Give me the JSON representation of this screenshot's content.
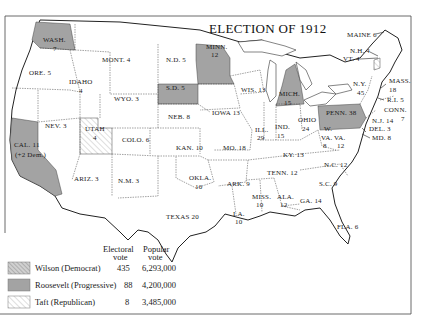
{
  "title": "ELECTION OF 1912",
  "colors": {
    "wilson_fill": "#c9c9c9",
    "wilson_hatch": "#8a8a8a",
    "roosevelt_fill": "#9d9d9d",
    "taft_fill": "#ffffff",
    "taft_hatch": "#b0b0b0",
    "lakes": "#ffffff",
    "frame": "#333333"
  },
  "states": [
    {
      "id": "wash",
      "label": "WASH.",
      "votes": "7",
      "party": "roosevelt"
    },
    {
      "id": "ore",
      "label": "ORE. 5",
      "party": "wilson"
    },
    {
      "id": "cal",
      "label": "CAL. 11",
      "sub": "(+2 Dem.)",
      "party": "roosevelt"
    },
    {
      "id": "nev",
      "label": "NEV. 3",
      "party": "wilson"
    },
    {
      "id": "idaho",
      "label": "IDAHO",
      "votes": "4",
      "party": "wilson"
    },
    {
      "id": "mont",
      "label": "MONT. 4",
      "party": "wilson"
    },
    {
      "id": "wyo",
      "label": "WYO. 3",
      "party": "wilson"
    },
    {
      "id": "utah",
      "label": "UTAH",
      "votes": "4",
      "party": "taft"
    },
    {
      "id": "colo",
      "label": "COLO. 6",
      "party": "wilson"
    },
    {
      "id": "ariz",
      "label": "ARIZ. 3",
      "party": "wilson"
    },
    {
      "id": "nm",
      "label": "N.M. 3",
      "party": "wilson"
    },
    {
      "id": "nd",
      "label": "N.D. 5",
      "party": "wilson"
    },
    {
      "id": "sd",
      "label": "S.D. 5",
      "party": "roosevelt"
    },
    {
      "id": "neb",
      "label": "NEB. 8",
      "party": "wilson"
    },
    {
      "id": "kan",
      "label": "KAN. 10",
      "party": "wilson"
    },
    {
      "id": "okla",
      "label": "OKLA.",
      "votes": "10",
      "party": "wilson"
    },
    {
      "id": "texas",
      "label": "TEXAS 20",
      "party": "wilson"
    },
    {
      "id": "minn",
      "label": "MINN.",
      "votes": "12",
      "party": "roosevelt"
    },
    {
      "id": "iowa",
      "label": "IOWA 13",
      "party": "wilson"
    },
    {
      "id": "mo",
      "label": "MO. 18",
      "party": "wilson"
    },
    {
      "id": "ark",
      "label": "ARK. 9",
      "party": "wilson"
    },
    {
      "id": "la",
      "label": "LA.",
      "votes": "10",
      "party": "wilson"
    },
    {
      "id": "wis",
      "label": "WIS. 13",
      "party": "wilson"
    },
    {
      "id": "ill",
      "label": "ILL.",
      "votes": "29",
      "party": "wilson"
    },
    {
      "id": "mich",
      "label": "MICH.",
      "votes": "15",
      "party": "roosevelt"
    },
    {
      "id": "ind",
      "label": "IND.",
      "votes": "15",
      "party": "wilson"
    },
    {
      "id": "ohio",
      "label": "OHIO",
      "votes": "24",
      "party": "wilson"
    },
    {
      "id": "ky",
      "label": "KY. 13",
      "party": "wilson"
    },
    {
      "id": "tenn",
      "label": "TENN. 12",
      "party": "wilson"
    },
    {
      "id": "miss",
      "label": "MISS.",
      "votes": "10",
      "party": "wilson"
    },
    {
      "id": "ala",
      "label": "ALA.",
      "votes": "12",
      "party": "wilson"
    },
    {
      "id": "ga",
      "label": "GA. 14",
      "party": "wilson"
    },
    {
      "id": "fla",
      "label": "FLA. 6",
      "party": "wilson"
    },
    {
      "id": "sc",
      "label": "S.C. 9",
      "party": "wilson"
    },
    {
      "id": "nc",
      "label": "N.C. 12",
      "party": "wilson"
    },
    {
      "id": "va",
      "label": "VA.",
      "votes": "12",
      "party": "wilson"
    },
    {
      "id": "wva",
      "label": "W.",
      "label2": "VA.",
      "votes": "8",
      "party": "wilson"
    },
    {
      "id": "penn",
      "label": "PENN. 38",
      "party": "roosevelt"
    },
    {
      "id": "ny",
      "label": "N.Y.",
      "votes": "45",
      "party": "wilson"
    },
    {
      "id": "maine",
      "label": "MAINE 6",
      "party": "wilson"
    },
    {
      "id": "nh",
      "label": "N.H. 4",
      "party": "wilson"
    },
    {
      "id": "vt",
      "label": "VT. 4",
      "party": "taft"
    },
    {
      "id": "mass",
      "label": "MASS.",
      "votes": "18",
      "party": "wilson"
    },
    {
      "id": "ri",
      "label": "R.I. 5",
      "party": "wilson"
    },
    {
      "id": "conn",
      "label": "CONN.",
      "votes": "7",
      "party": "wilson"
    },
    {
      "id": "nj",
      "label": "N.J. 14",
      "party": "wilson"
    },
    {
      "id": "del",
      "label": "DEL. 3",
      "party": "wilson"
    },
    {
      "id": "md",
      "label": "MD. 8",
      "party": "wilson"
    }
  ],
  "legend": {
    "col_electoral_line1": "Electoral",
    "col_electoral_line2": "vote",
    "col_popular_line1": "Popular",
    "col_popular_line2": "vote",
    "rows": [
      {
        "name": "Wilson (Democrat)",
        "electoral": "435",
        "popular": "6,293,000",
        "pattern": "wilson"
      },
      {
        "name": "Roosevelt (Progressive)",
        "electoral": "88",
        "popular": "4,200,000",
        "pattern": "roosevelt"
      },
      {
        "name": "Taft (Republican)",
        "electoral": "8",
        "popular": "3,485,000",
        "pattern": "taft"
      }
    ]
  }
}
